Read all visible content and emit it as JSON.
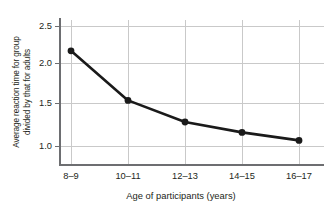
{
  "chart_data": {
    "type": "line",
    "title": "",
    "categories": [
      "8–9",
      "10–11",
      "12–13",
      "14–15",
      "16–17"
    ],
    "values": [
      2.19,
      1.57,
      1.3,
      1.17,
      1.07
    ],
    "series": [
      {
        "name": "Average reaction time ratio",
        "values": [
          2.19,
          1.57,
          1.3,
          1.17,
          1.07
        ]
      }
    ],
    "xlabel": "Age of participants (years)",
    "ylabel": "Average reaction time for group divided by that for adults",
    "ylabel_lines": [
      "Average reaction time for group",
      "divided by that for adults"
    ],
    "yticks": [
      "1.0",
      "1.5",
      "2.0",
      "2.5"
    ],
    "ytick_values": [
      1.0,
      1.5,
      2.0,
      2.5
    ],
    "ylim": [
      0.86,
      2.66
    ],
    "xlim": [
      0,
      4
    ],
    "grid": true,
    "legend": false,
    "marker": "circle",
    "line_color": "#1a1a1a",
    "marker_color": "#1a1a1a",
    "grid_color": "#c9c9c9",
    "axis_color": "#6d6e71",
    "text_color": "#231f20",
    "background": "#ffffff"
  },
  "axes": {
    "y_title_line1": "Average reaction time for group",
    "y_title_line2": "divided by that for adults",
    "x_title": "Age of participants (years)",
    "y_tick_labels": [
      "2.5",
      "2.0",
      "1.5",
      "1.0"
    ],
    "x_tick_labels": [
      "8–9",
      "10–11",
      "12–13",
      "14–15",
      "16–17"
    ]
  }
}
